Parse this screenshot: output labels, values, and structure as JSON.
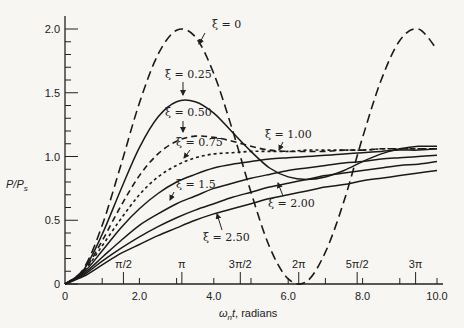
{
  "chart_data": {
    "type": "line",
    "title": "",
    "xlabel": "ω_n t, radians",
    "ylabel": "P/P_s",
    "xlim": [
      0,
      10
    ],
    "ylim": [
      0,
      2.1
    ],
    "grid": false,
    "x_ticks": [
      {
        "value": 0,
        "label": "0"
      },
      {
        "value": 2,
        "label": "2.0"
      },
      {
        "value": 4,
        "label": "4.0"
      },
      {
        "value": 6,
        "label": "6.0"
      },
      {
        "value": 8,
        "label": "8.0"
      },
      {
        "value": 10,
        "label": "10.0"
      }
    ],
    "x_minor_ticks": [
      1,
      3,
      5,
      7,
      9
    ],
    "pi_ticks": [
      {
        "value": 1.5708,
        "label": "π/2"
      },
      {
        "value": 3.1416,
        "label": "π"
      },
      {
        "value": 4.7124,
        "label": "3π/2"
      },
      {
        "value": 6.2832,
        "label": "2π"
      },
      {
        "value": 7.854,
        "label": "5π/2"
      },
      {
        "value": 9.4248,
        "label": "3π"
      }
    ],
    "y_ticks": [
      {
        "value": 0,
        "label": "0"
      },
      {
        "value": 0.5,
        "label": "0.5"
      },
      {
        "value": 1.0,
        "label": "1.0"
      },
      {
        "value": 1.5,
        "label": "1.5"
      },
      {
        "value": 2.0,
        "label": "2.0"
      }
    ],
    "y_minor_step": 0.1,
    "x": [
      0,
      0.5,
      1,
      1.5,
      2,
      2.5,
      3,
      3.5,
      4,
      4.5,
      5,
      5.5,
      6,
      6.5,
      7,
      7.5,
      8,
      8.5,
      9,
      9.5,
      10
    ],
    "series": [
      {
        "name": "ξ = 0",
        "style": "dashed-long",
        "values": [
          0,
          0.12,
          0.46,
          0.93,
          1.42,
          1.8,
          1.99,
          1.94,
          1.65,
          1.21,
          0.72,
          0.29,
          0.04,
          0.02,
          0.25,
          0.65,
          1.15,
          1.6,
          1.91,
          2.0,
          1.84
        ]
      },
      {
        "name": "ξ = 0.25",
        "style": "solid",
        "values": [
          0,
          0.11,
          0.39,
          0.74,
          1.07,
          1.31,
          1.43,
          1.43,
          1.34,
          1.19,
          1.04,
          0.91,
          0.84,
          0.82,
          0.84,
          0.89,
          0.96,
          1.02,
          1.06,
          1.08,
          1.08
        ]
      },
      {
        "name": "ξ = 0.50",
        "style": "dashed",
        "values": [
          0,
          0.1,
          0.34,
          0.61,
          0.85,
          1.02,
          1.12,
          1.16,
          1.15,
          1.12,
          1.08,
          1.05,
          1.04,
          1.04,
          1.04,
          1.05,
          1.05,
          1.06,
          1.06,
          1.06,
          1.06
        ]
      },
      {
        "name": "ξ = 0.75",
        "style": "dotted-dash",
        "values": [
          0,
          0.1,
          0.3,
          0.51,
          0.7,
          0.84,
          0.93,
          0.99,
          1.02,
          1.03,
          1.04,
          1.04,
          1.04,
          1.05,
          1.05,
          1.05,
          1.05,
          1.06,
          1.06,
          1.06,
          1.06
        ]
      },
      {
        "name": "ξ = 1.00",
        "style": "solid",
        "values": [
          0,
          0.09,
          0.26,
          0.44,
          0.59,
          0.71,
          0.8,
          0.86,
          0.91,
          0.94,
          0.96,
          0.98,
          0.99,
          1.0,
          1.01,
          1.02,
          1.03,
          1.04,
          1.05,
          1.05,
          1.06
        ]
      },
      {
        "name": "ξ = 1.5",
        "style": "solid",
        "values": [
          0,
          0.08,
          0.21,
          0.34,
          0.46,
          0.55,
          0.63,
          0.69,
          0.75,
          0.79,
          0.83,
          0.86,
          0.89,
          0.91,
          0.93,
          0.95,
          0.96,
          0.98,
          0.99,
          1.0,
          1.01
        ]
      },
      {
        "name": "ξ = 2.00",
        "style": "solid",
        "values": [
          0,
          0.07,
          0.18,
          0.28,
          0.37,
          0.45,
          0.52,
          0.58,
          0.63,
          0.68,
          0.72,
          0.76,
          0.79,
          0.82,
          0.85,
          0.87,
          0.89,
          0.91,
          0.93,
          0.94,
          0.96
        ]
      },
      {
        "name": "ξ = 2.50",
        "style": "solid",
        "values": [
          0,
          0.06,
          0.15,
          0.24,
          0.31,
          0.38,
          0.44,
          0.5,
          0.55,
          0.59,
          0.63,
          0.67,
          0.7,
          0.73,
          0.76,
          0.78,
          0.81,
          0.83,
          0.85,
          0.87,
          0.89
        ]
      }
    ],
    "annotations": [
      {
        "label": "ξ = 0",
        "text_x": 212,
        "text_y": 28,
        "arrow_from": [
          205,
          33
        ],
        "arrow_to": [
          199,
          44
        ]
      },
      {
        "label": "ξ = 0.25",
        "text_x": 165,
        "text_y": 78,
        "arrow_from": [
          183,
          82
        ],
        "arrow_to": [
          183,
          95
        ]
      },
      {
        "label": "ξ = 0.50",
        "text_x": 165,
        "text_y": 116,
        "arrow_from": [
          183,
          121
        ],
        "arrow_to": [
          183,
          132
        ]
      },
      {
        "label": "ξ = 0.75",
        "text_x": 176,
        "text_y": 146,
        "arrow_from": [
          190,
          150
        ],
        "arrow_to": [
          184,
          158
        ]
      },
      {
        "label": "ξ = 1.00",
        "text_x": 265,
        "text_y": 138,
        "arrow_from": [
          283,
          142
        ],
        "arrow_to": [
          279,
          150
        ]
      },
      {
        "label": "ξ = 1.5",
        "text_x": 176,
        "text_y": 188,
        "arrow_from": [
          174,
          192
        ],
        "arrow_to": [
          170,
          200
        ]
      },
      {
        "label": "ξ = 2.00",
        "text_x": 268,
        "text_y": 207,
        "arrow_from": [
          283,
          196
        ],
        "arrow_to": [
          278,
          183
        ]
      },
      {
        "label": "ξ = 2.50",
        "text_x": 203,
        "text_y": 241,
        "arrow_from": [
          222,
          230
        ],
        "arrow_to": [
          217,
          214
        ]
      }
    ]
  }
}
